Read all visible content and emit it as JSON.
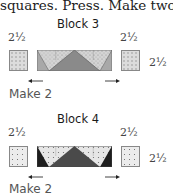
{
  "intro_text": "squares. Press. Make two.",
  "blocks": [
    {
      "title": "Block 3",
      "left_dim": "2½",
      "right_dim": "2½",
      "side_dim": "2½",
      "make_label": "Make 2",
      "colors": {
        "background_fabric": "#d8d8d8",
        "goose_fabric": "#8a8a8a",
        "corner_fabric": "#b0b0b0"
      }
    },
    {
      "title": "Block 4",
      "left_dim": "2½",
      "right_dim": "2½",
      "side_dim": "2½",
      "make_label": "Make 2",
      "colors": {
        "background_fabric": "#e6e6e6",
        "goose_fabric": "#4a4a4a",
        "corner_fabric": "#222222"
      }
    }
  ]
}
